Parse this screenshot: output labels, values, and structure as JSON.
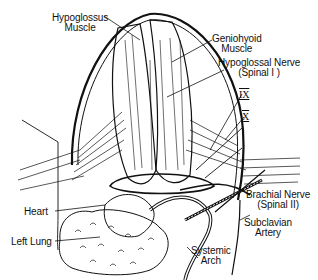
{
  "diagram": {
    "type": "anatomical-illustration",
    "labels": {
      "hypoglossus_muscle": [
        "Hypoglossus",
        "Muscle"
      ],
      "geniohyoid_muscle": [
        "Geniohyoid",
        "Muscle"
      ],
      "hypoglossal_nerve": [
        "Hypoglossal Nerve",
        "(Spinal I )"
      ],
      "nerve_ix": "IX",
      "nerve_x": "X",
      "brachial_nerve": [
        "Brachial Nerve",
        "(Spinal II)"
      ],
      "subclavian_artery": [
        "Subclavian",
        "Artery"
      ],
      "systemic_arch": [
        "Systemic",
        "Arch"
      ],
      "heart": "Heart",
      "left_lung": "Left Lung"
    },
    "colors": {
      "ink": "#111111",
      "background": "#ffffff"
    }
  }
}
